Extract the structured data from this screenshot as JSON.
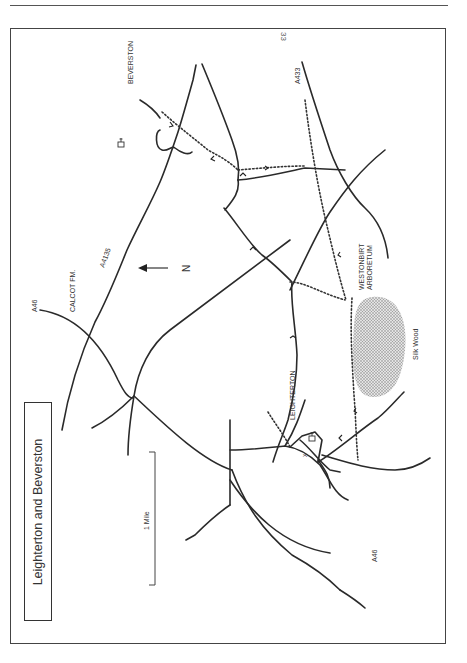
{
  "page": {
    "number": "33"
  },
  "map": {
    "title": "Leighterton and Beverston",
    "scale_label": "1 Mile",
    "north_label": "N",
    "orientation": "rotated 90° — north points left",
    "places": [
      {
        "id": "beverston",
        "label": "BEVERSTON"
      },
      {
        "id": "calcot",
        "label": "CALCOT FM."
      },
      {
        "id": "leighterton",
        "label": "LEIGHTERTON"
      },
      {
        "id": "westonbirt-1",
        "label": "WESTONBIRT"
      },
      {
        "id": "westonbirt-2",
        "label": "ARBORETUM"
      },
      {
        "id": "silk-wood",
        "label": "Silk Wood"
      }
    ],
    "roads": [
      {
        "id": "a46-north",
        "label": "A46"
      },
      {
        "id": "a4135",
        "label": "A4135"
      },
      {
        "id": "a433",
        "label": "A433"
      },
      {
        "id": "a46-south",
        "label": "A46"
      }
    ],
    "colors": {
      "ink": "#2a2a2a",
      "woodland": "#bdbdbd",
      "paper": "#ffffff"
    }
  }
}
